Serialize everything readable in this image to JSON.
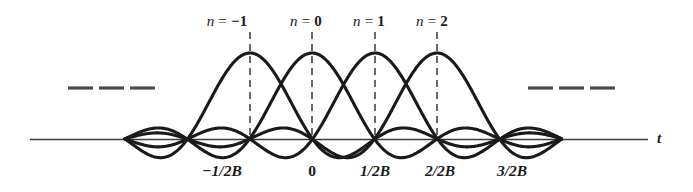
{
  "figure": {
    "axis_label_t": "t",
    "ellipsis_left": "— — —",
    "ellipsis_right": "— — —",
    "n_labels": [
      {
        "prefix": "n",
        "eq": " = ",
        "value": "−1"
      },
      {
        "prefix": "n",
        "eq": " = ",
        "value": "0"
      },
      {
        "prefix": "n",
        "eq": " = ",
        "value": "1"
      },
      {
        "prefix": "n",
        "eq": " = ",
        "value": "2"
      }
    ],
    "tick_labels": [
      "−1/2B",
      "0",
      "1/2B",
      "2/2B",
      "3/2B"
    ],
    "colors": {
      "curve": "#1a1a1a",
      "axis": "#3b3b3b",
      "dash": "#2a2a2a",
      "text": "#1a1a1a",
      "background": "#ffffff"
    }
  },
  "chart_data": {
    "type": "line",
    "title": "",
    "subtitle": "",
    "xlabel": "t",
    "ylabel": "",
    "grid": false,
    "legend": "none",
    "function": "sinc(2Bt - n)",
    "x_axis": {
      "baseline_y_px": 139,
      "tick_positions_px": [
        250,
        312,
        375,
        437,
        500
      ],
      "tick_labels": [
        "−1/2B",
        "0",
        "1/2B",
        "2/2B",
        "3/2B"
      ],
      "tick_values": [
        "-1/2B",
        "0",
        "1/2B",
        "2/2B",
        "3/2B"
      ],
      "axis_start_px": 30,
      "axis_end_px": 648,
      "sample_spacing_px": 62.5
    },
    "y_axis": {
      "peak_amplitude": 1,
      "peak_y_px": 53,
      "baseline_value": 0
    },
    "series": [
      {
        "name": "n = -1",
        "label": "n = −1",
        "peak_x_px": 250,
        "peak_x_value": "-1/2B",
        "peak_value": 1,
        "zero_crossings_px": [
          125,
          188,
          312,
          375,
          437,
          500
        ],
        "dashed_guide": true
      },
      {
        "name": "n = 0",
        "label": "n = 0",
        "peak_x_px": 312,
        "peak_x_value": "0",
        "peak_value": 1,
        "zero_crossings_px": [
          125,
          188,
          250,
          375,
          437,
          500,
          562
        ],
        "dashed_guide": true
      },
      {
        "name": "n = 1",
        "label": "n = 1",
        "peak_x_px": 375,
        "peak_x_value": "1/2B",
        "peak_value": 1,
        "zero_crossings_px": [
          188,
          250,
          312,
          437,
          500,
          562
        ],
        "dashed_guide": true
      },
      {
        "name": "n = 2",
        "label": "n = 2",
        "peak_x_px": 437,
        "peak_x_value": "2/2B",
        "peak_value": 1,
        "zero_crossings_px": [
          250,
          312,
          375,
          500,
          562
        ],
        "dashed_guide": true
      }
    ],
    "annotations": [
      {
        "text": "— — —",
        "role": "ellipsis-left",
        "x_px": 109,
        "y_px": 88
      },
      {
        "text": "— — —",
        "role": "ellipsis-right",
        "x_px": 572,
        "y_px": 88
      },
      {
        "text": "t",
        "role": "axis-label",
        "x_px": 660,
        "y_px": 139
      }
    ]
  }
}
